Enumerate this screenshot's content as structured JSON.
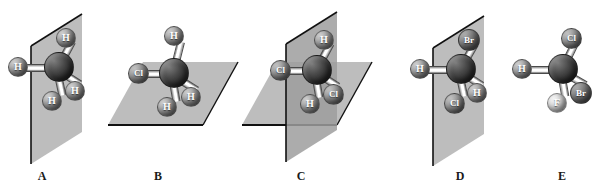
{
  "figure": {
    "background_color": "#ffffff",
    "plane_fill_color": "#bdbdbd",
    "plane_edge_color": "#111111",
    "carbon_color": "#242424",
    "hydrogen_color": "#8a8a8a",
    "chlorine_color": "#7d7d7d",
    "bromine_color": "#5f5f5f",
    "fluorine_color": "#d8d8d8"
  },
  "panels": [
    {
      "caption": "A",
      "molecule": "CH4",
      "plane_count": 1,
      "plane_orientation": "vertical",
      "chiral": false,
      "atoms": [
        {
          "element": "C",
          "label": "C",
          "position": "center"
        },
        {
          "element": "H",
          "label": "H",
          "position": "top-right"
        },
        {
          "element": "H",
          "label": "H",
          "position": "left"
        },
        {
          "element": "H",
          "label": "H",
          "position": "lower-right"
        },
        {
          "element": "H",
          "label": "H",
          "position": "bottom"
        }
      ]
    },
    {
      "caption": "B",
      "molecule": "CH3Cl",
      "plane_count": 1,
      "plane_orientation": "horizontal",
      "chiral": false,
      "atoms": [
        {
          "element": "C",
          "label": "C",
          "position": "center"
        },
        {
          "element": "H",
          "label": "H",
          "position": "top"
        },
        {
          "element": "Cl",
          "label": "Cl",
          "position": "left"
        },
        {
          "element": "H",
          "label": "H",
          "position": "lower-right"
        },
        {
          "element": "H",
          "label": "H",
          "position": "bottom"
        }
      ]
    },
    {
      "caption": "C",
      "molecule": "CH2Cl2",
      "plane_count": 2,
      "plane_orientation": "vertical-and-horizontal",
      "chiral": false,
      "atoms": [
        {
          "element": "C",
          "label": "C",
          "position": "center"
        },
        {
          "element": "H",
          "label": "H",
          "position": "top-right"
        },
        {
          "element": "Cl",
          "label": "Cl",
          "position": "left"
        },
        {
          "element": "Cl",
          "label": "Cl",
          "position": "lower-right"
        },
        {
          "element": "H",
          "label": "H",
          "position": "bottom"
        }
      ]
    },
    {
      "caption": "D",
      "molecule": "CH2BrCl",
      "plane_count": 1,
      "plane_orientation": "vertical",
      "chiral": false,
      "atoms": [
        {
          "element": "C",
          "label": "C",
          "position": "center"
        },
        {
          "element": "Br",
          "label": "Br",
          "position": "top-right"
        },
        {
          "element": "H",
          "label": "H",
          "position": "left"
        },
        {
          "element": "H",
          "label": "H",
          "position": "lower-right"
        },
        {
          "element": "Cl",
          "label": "Cl",
          "position": "bottom"
        }
      ]
    },
    {
      "caption": "E",
      "molecule": "CHFClBr",
      "plane_count": 0,
      "plane_orientation": "none",
      "chiral": true,
      "atoms": [
        {
          "element": "C",
          "label": "C",
          "position": "center"
        },
        {
          "element": "Cl",
          "label": "Cl",
          "position": "top-right"
        },
        {
          "element": "H",
          "label": "H",
          "position": "left"
        },
        {
          "element": "Br",
          "label": "Br",
          "position": "lower-right"
        },
        {
          "element": "F",
          "label": "F",
          "position": "bottom"
        }
      ]
    }
  ]
}
